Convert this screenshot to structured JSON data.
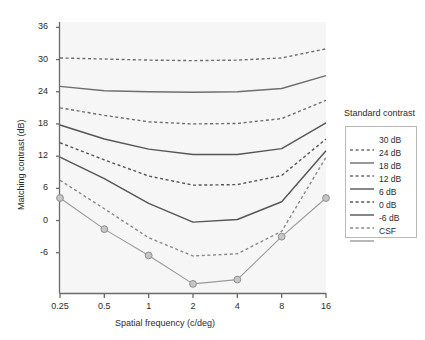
{
  "chart_data": {
    "type": "line",
    "title": "",
    "xlabel": "Spatial frequency (c/deg)",
    "ylabel": "Matching contrast (dB)",
    "xscale": "log",
    "xticks": [
      "0.25",
      "0.5",
      "1",
      "2",
      "4",
      "8",
      "16"
    ],
    "xtick_values": [
      0.25,
      0.5,
      1,
      2,
      4,
      8,
      16
    ],
    "xlim": [
      0.25,
      16
    ],
    "yticks": [
      "36",
      "30",
      "24",
      "18",
      "12",
      "6",
      "0",
      "-6"
    ],
    "ytick_values": [
      36,
      30,
      24,
      18,
      12,
      6,
      0,
      -6
    ],
    "ylim": [
      -13.5,
      37
    ],
    "grid": false,
    "legend_position": "right-outside",
    "legend_title": "Standard contrast",
    "x": [
      0.25,
      0.5,
      1,
      2,
      4,
      8,
      16
    ],
    "series": [
      {
        "name": "30 dB",
        "label": "30 dB",
        "style": "dashed",
        "color": "#6e6e6e",
        "markers": false,
        "values": [
          30.3,
          30.1,
          29.9,
          29.8,
          29.9,
          30.3,
          32.0
        ]
      },
      {
        "name": "24 dB",
        "label": "24 dB",
        "style": "solid",
        "color": "#6e6e6e",
        "markers": false,
        "values": [
          25.0,
          24.2,
          24.0,
          23.9,
          24.0,
          24.6,
          27.0
        ]
      },
      {
        "name": "18 dB",
        "label": "18 dB",
        "style": "dashed",
        "color": "#6e6e6e",
        "markers": false,
        "values": [
          21.0,
          19.6,
          18.4,
          18.0,
          18.1,
          19.0,
          22.4
        ]
      },
      {
        "name": "12 dB",
        "label": "12 dB",
        "style": "solid",
        "color": "#555555",
        "markers": false,
        "values": [
          17.8,
          15.2,
          13.3,
          12.3,
          12.3,
          13.4,
          18.2
        ]
      },
      {
        "name": "6 dB",
        "label": "6 dB",
        "style": "dashed",
        "color": "#555555",
        "markers": false,
        "values": [
          14.5,
          11.3,
          8.3,
          6.6,
          6.7,
          8.4,
          15.2
        ]
      },
      {
        "name": "0 dB",
        "label": "0 dB",
        "style": "solid",
        "color": "#555555",
        "markers": false,
        "values": [
          11.8,
          7.8,
          3.2,
          -0.3,
          0.2,
          3.5,
          13.0
        ]
      },
      {
        "name": "-6 dB",
        "label": "-6 dB",
        "style": "dashed",
        "color": "#8a8a8a",
        "markers": false,
        "values": [
          7.5,
          2.2,
          -3.2,
          -6.6,
          -6.2,
          -2.0,
          11.8
        ]
      },
      {
        "name": "CSF",
        "label": "CSF",
        "style": "solid",
        "color": "#9a9a9a",
        "markers": true,
        "values": [
          4.2,
          -1.6,
          -6.5,
          -11.8,
          -11.0,
          -3.0,
          4.2
        ]
      }
    ]
  }
}
